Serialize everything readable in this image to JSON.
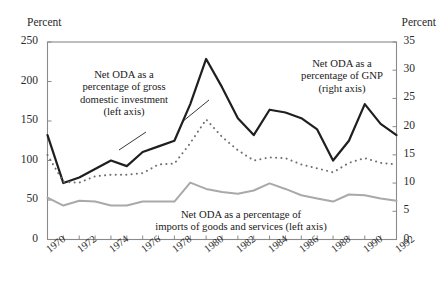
{
  "axes": {
    "left_title": "Percent",
    "right_title": "Percent",
    "left_ticks": [
      "0",
      "50",
      "100",
      "150",
      "200",
      "250"
    ],
    "right_ticks": [
      "0",
      "5",
      "10",
      "15",
      "20",
      "25",
      "30",
      "35"
    ],
    "x_ticks": [
      "1970",
      "1972",
      "1974",
      "1976",
      "1978",
      "1980",
      "1982",
      "1984",
      "1986",
      "1988",
      "1990",
      "1992"
    ]
  },
  "annotations": {
    "gdi": "Net ODA as a\npercentage of gross\ndomestic investment\n(left axis)",
    "gnp": "Net ODA as a\npercentage of GNP\n(right axis)",
    "imports": "Net ODA as a percentage of\nimports of goods and services (left axis)"
  },
  "colors": {
    "solid_black": "#1f1f1f",
    "dotted_gray": "#6f6f6f",
    "solid_gray": "#a9a9a9",
    "frame": "#8a8a8a",
    "text": "#1a1a1a"
  },
  "chart_data": {
    "type": "line",
    "title": "",
    "xlabel": "",
    "ylabel": "Percent",
    "y2label": "Percent",
    "xlim": [
      1970,
      1992
    ],
    "ylim": [
      0,
      250
    ],
    "y2lim": [
      0,
      35
    ],
    "grid": false,
    "legend": "inline-annotations",
    "x": [
      1970,
      1971,
      1972,
      1973,
      1974,
      1975,
      1976,
      1977,
      1978,
      1979,
      1980,
      1981,
      1982,
      1983,
      1984,
      1985,
      1986,
      1987,
      1988,
      1989,
      1990,
      1991,
      1992
    ],
    "series": [
      {
        "name": "Net ODA as a percentage of GNP (right axis)",
        "axis": "right",
        "style": "solid",
        "color": "#1f1f1f",
        "units": "percent of GNP",
        "values": [
          18.5,
          10.0,
          11.0,
          12.5,
          14.0,
          13.0,
          15.5,
          16.5,
          17.5,
          24.0,
          32.0,
          27.0,
          21.5,
          18.5,
          23.0,
          22.5,
          21.5,
          19.5,
          14.0,
          17.5,
          24.0,
          20.5,
          18.5
        ]
      },
      {
        "name": "Net ODA as a percentage of gross domestic investment (left axis)",
        "axis": "left",
        "style": "dotted",
        "color": "#6f6f6f",
        "units": "percent of gross domestic investment",
        "values": [
          107,
          73,
          72,
          80,
          82,
          82,
          84,
          95,
          96,
          122,
          152,
          130,
          113,
          100,
          104,
          103,
          95,
          90,
          85,
          97,
          103,
          97,
          95
        ]
      },
      {
        "name": "Net ODA as a percentage of imports of goods and services (left axis)",
        "axis": "left",
        "style": "solid",
        "color": "#a9a9a9",
        "units": "percent of imports of goods and services",
        "values": [
          53,
          43,
          49,
          48,
          43,
          43,
          48,
          48,
          48,
          72,
          64,
          60,
          58,
          62,
          71,
          64,
          56,
          52,
          48,
          57,
          56,
          52,
          49
        ]
      }
    ]
  }
}
